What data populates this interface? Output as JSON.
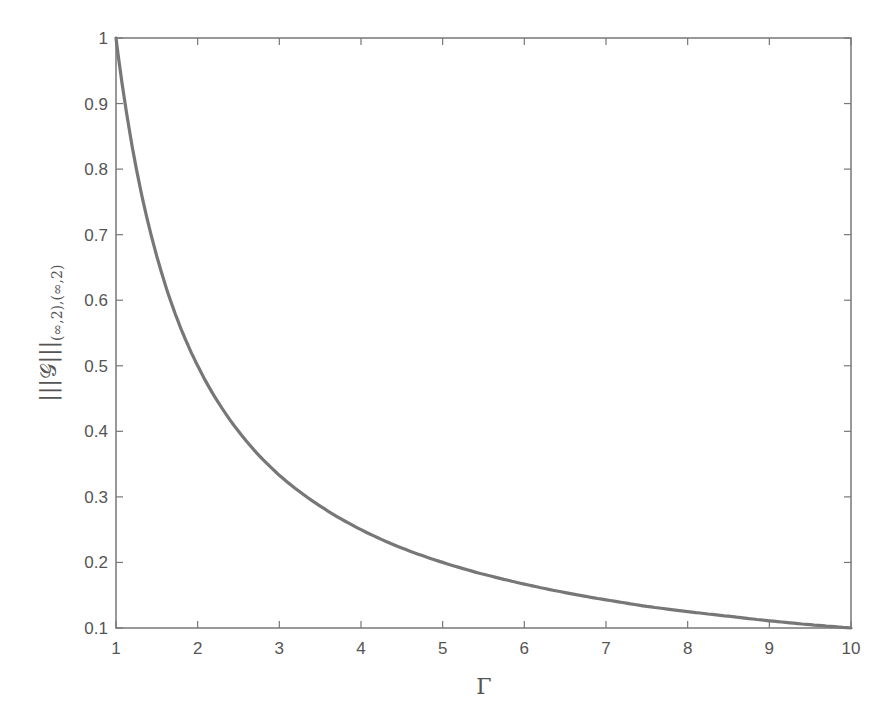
{
  "chart_data": {
    "type": "line",
    "title": "",
    "xlabel": "Γ",
    "ylabel": "|||𝒢|||",
    "ylabel_subscript": "(∞,2),(∞,2)",
    "xlim": [
      1,
      10
    ],
    "ylim": [
      0.1,
      1
    ],
    "xticks": [
      1,
      2,
      3,
      4,
      5,
      6,
      7,
      8,
      9,
      10
    ],
    "yticks": [
      0.1,
      0.2,
      0.3,
      0.4,
      0.5,
      0.6,
      0.7,
      0.8,
      0.9,
      1
    ],
    "xtick_labels": [
      "1",
      "2",
      "3",
      "4",
      "5",
      "6",
      "7",
      "8",
      "9",
      "10"
    ],
    "ytick_labels": [
      "0.1",
      "0.2",
      "0.3",
      "0.4",
      "0.5",
      "0.6",
      "0.7",
      "0.8",
      "0.9",
      "1"
    ],
    "grid": false,
    "legend": null,
    "series": [
      {
        "name": "norm",
        "color": "#777777",
        "x": [
          1,
          1.25,
          1.5,
          1.75,
          2,
          2.5,
          3,
          3.5,
          4,
          4.5,
          5,
          5.5,
          6,
          6.5,
          7,
          7.5,
          8,
          8.5,
          9,
          9.5,
          10
        ],
        "y": [
          1.0,
          0.8,
          0.667,
          0.571,
          0.5,
          0.4,
          0.333,
          0.286,
          0.25,
          0.222,
          0.2,
          0.182,
          0.167,
          0.154,
          0.143,
          0.133,
          0.125,
          0.118,
          0.111,
          0.105,
          0.1
        ]
      }
    ]
  },
  "colors": {
    "axis": "#777777",
    "curve": "#777777",
    "text": "#555555",
    "background": "#ffffff"
  }
}
